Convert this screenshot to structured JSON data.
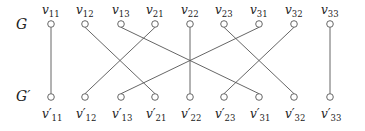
{
  "graphs": {
    "top_label": "G",
    "bottom_label": "G′"
  },
  "nodes": {
    "top": [
      {
        "id": "v11",
        "base": "v",
        "sub": "11",
        "x": 51
      },
      {
        "id": "v12",
        "base": "v",
        "sub": "12",
        "x": 85
      },
      {
        "id": "v13",
        "base": "v",
        "sub": "13",
        "x": 121
      },
      {
        "id": "v21",
        "base": "v",
        "sub": "21",
        "x": 155
      },
      {
        "id": "v22",
        "base": "v",
        "sub": "22",
        "x": 190
      },
      {
        "id": "v23",
        "base": "v",
        "sub": "23",
        "x": 224
      },
      {
        "id": "v31",
        "base": "v",
        "sub": "31",
        "x": 259
      },
      {
        "id": "v32",
        "base": "v",
        "sub": "32",
        "x": 294
      },
      {
        "id": "v33",
        "base": "v",
        "sub": "33",
        "x": 330
      }
    ],
    "bottom": [
      {
        "id": "v11p",
        "base": "v′",
        "sub": "11",
        "x": 51
      },
      {
        "id": "v12p",
        "base": "v′",
        "sub": "12",
        "x": 85
      },
      {
        "id": "v13p",
        "base": "v′",
        "sub": "13",
        "x": 121
      },
      {
        "id": "v21p",
        "base": "v′",
        "sub": "21",
        "x": 155
      },
      {
        "id": "v22p",
        "base": "v′",
        "sub": "22",
        "x": 190
      },
      {
        "id": "v23p",
        "base": "v′",
        "sub": "23",
        "x": 224
      },
      {
        "id": "v31p",
        "base": "v′",
        "sub": "31",
        "x": 259
      },
      {
        "id": "v32p",
        "base": "v′",
        "sub": "32",
        "x": 294
      },
      {
        "id": "v33p",
        "base": "v′",
        "sub": "33",
        "x": 330
      }
    ]
  },
  "edges": [
    [
      "v11",
      "v11p"
    ],
    [
      "v12",
      "v21p"
    ],
    [
      "v13",
      "v31p"
    ],
    [
      "v21",
      "v12p"
    ],
    [
      "v22",
      "v22p"
    ],
    [
      "v23",
      "v32p"
    ],
    [
      "v31",
      "v13p"
    ],
    [
      "v32",
      "v23p"
    ],
    [
      "v33",
      "v33p"
    ]
  ],
  "layout": {
    "top_y": 24,
    "bottom_y": 97,
    "node_r": 3.3,
    "edge_color": "#555555",
    "node_color": "#555555"
  }
}
